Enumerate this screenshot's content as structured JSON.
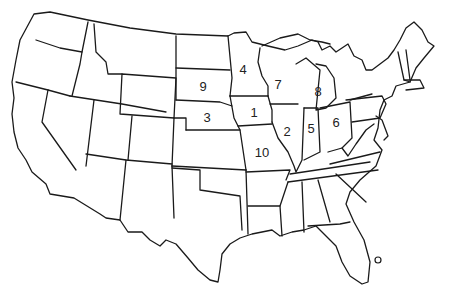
{
  "map": {
    "title": "Outline map of the contiguous United States",
    "stroke_color": "#1a1a1a",
    "background": "#ffffff",
    "labels": [
      {
        "number": "1",
        "x": 254,
        "y": 112
      },
      {
        "number": "2",
        "x": 287,
        "y": 131
      },
      {
        "number": "3",
        "x": 207,
        "y": 117
      },
      {
        "number": "4",
        "x": 243,
        "y": 69
      },
      {
        "number": "5",
        "x": 311,
        "y": 128
      },
      {
        "number": "6",
        "x": 336,
        "y": 122
      },
      {
        "number": "7",
        "x": 278,
        "y": 84
      },
      {
        "number": "8",
        "x": 318,
        "y": 91
      },
      {
        "number": "9",
        "x": 203,
        "y": 86
      },
      {
        "number": "10",
        "x": 262,
        "y": 152
      }
    ]
  }
}
